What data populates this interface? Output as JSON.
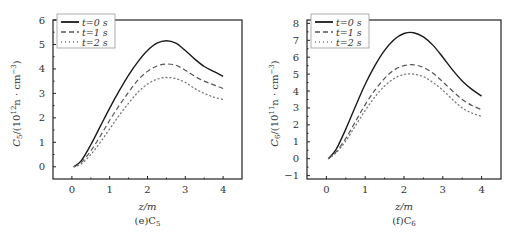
{
  "chart_data": [
    {
      "type": "line",
      "panel_label": "(e)C5",
      "title": "",
      "xlabel": "z/m",
      "ylabel": "C5/(10^12 n · cm^-3)",
      "xlim": [
        -0.5,
        4.5
      ],
      "ylim": [
        -0.5,
        6
      ],
      "xticks": [
        0,
        1,
        2,
        3,
        4
      ],
      "yticks": [
        0,
        1,
        2,
        3,
        4,
        5,
        6
      ],
      "grid": false,
      "legend_position": "upper left",
      "x": [
        0.05,
        0.25,
        0.5,
        0.75,
        1.0,
        1.25,
        1.5,
        1.75,
        2.0,
        2.25,
        2.5,
        2.75,
        3.0,
        3.25,
        3.5,
        3.75,
        4.0
      ],
      "series": [
        {
          "name": "t=0 s",
          "style": "solid",
          "values": [
            0.0,
            0.25,
            0.9,
            1.65,
            2.4,
            3.1,
            3.75,
            4.3,
            4.75,
            5.05,
            5.15,
            5.05,
            4.75,
            4.4,
            4.1,
            3.9,
            3.7
          ]
        },
        {
          "name": "t=1 s",
          "style": "dashed",
          "values": [
            0.0,
            0.18,
            0.65,
            1.25,
            1.9,
            2.5,
            3.05,
            3.55,
            3.9,
            4.12,
            4.2,
            4.15,
            3.95,
            3.7,
            3.5,
            3.35,
            3.2
          ]
        },
        {
          "name": "t=2 s",
          "style": "dotted",
          "values": [
            0.0,
            0.12,
            0.5,
            1.0,
            1.55,
            2.1,
            2.6,
            3.05,
            3.38,
            3.58,
            3.65,
            3.6,
            3.45,
            3.2,
            3.0,
            2.85,
            2.75
          ]
        }
      ]
    },
    {
      "type": "line",
      "panel_label": "(f)C6",
      "title": "",
      "xlabel": "z/m",
      "ylabel": "C6/(10^11 n · cm^-3)",
      "xlim": [
        -0.5,
        4.5
      ],
      "ylim": [
        -1.2,
        8.2
      ],
      "xticks": [
        0,
        1,
        2,
        3,
        4
      ],
      "yticks": [
        -1,
        0,
        1,
        2,
        3,
        4,
        5,
        6,
        7,
        8
      ],
      "grid": false,
      "legend_position": "upper left",
      "x": [
        0.05,
        0.25,
        0.5,
        0.75,
        1.0,
        1.25,
        1.5,
        1.75,
        2.0,
        2.25,
        2.5,
        2.75,
        3.0,
        3.25,
        3.5,
        3.75,
        4.0
      ],
      "series": [
        {
          "name": "t=0 s",
          "style": "solid",
          "values": [
            0.0,
            0.55,
            1.75,
            3.1,
            4.4,
            5.5,
            6.4,
            7.05,
            7.4,
            7.45,
            7.2,
            6.7,
            6.0,
            5.25,
            4.6,
            4.1,
            3.7
          ]
        },
        {
          "name": "t=1 s",
          "style": "dashed",
          "values": [
            0.0,
            0.4,
            1.2,
            2.2,
            3.2,
            4.05,
            4.75,
            5.25,
            5.5,
            5.55,
            5.4,
            5.05,
            4.55,
            4.0,
            3.5,
            3.15,
            2.9
          ]
        },
        {
          "name": "t=2 s",
          "style": "dotted",
          "values": [
            0.0,
            0.35,
            1.05,
            1.95,
            2.85,
            3.65,
            4.3,
            4.75,
            4.98,
            5.0,
            4.85,
            4.5,
            4.05,
            3.5,
            3.0,
            2.7,
            2.5
          ]
        }
      ]
    }
  ],
  "panels": [
    {
      "ylabel_main": "C",
      "ylabel_sub": "5",
      "ylabel_rest": "/(10",
      "ylabel_sup": "12",
      "ylabel_tail": "n · cm",
      "ylabel_sup2": "−3",
      "ylabel_close": ")",
      "xlabel": "z/m",
      "caption_prefix": "(e)C",
      "caption_sub": "5",
      "legend": [
        "t=0  s",
        "t=1  s",
        "t=2  s"
      ]
    },
    {
      "ylabel_main": "C",
      "ylabel_sub": "6",
      "ylabel_rest": "/(10",
      "ylabel_sup": "11",
      "ylabel_tail": "n · cm",
      "ylabel_sup2": "−3",
      "ylabel_close": ")",
      "xlabel": "z/m",
      "caption_prefix": "(f)C",
      "caption_sub": "6",
      "legend": [
        "t=0  s",
        "t=1  s",
        "t=2  s"
      ]
    }
  ],
  "colors": {
    "axis": "#222222",
    "solid": "#1a1a1a",
    "dashed": "#555555",
    "dotted": "#777777",
    "text": "#333333",
    "legend_border": "#999999"
  }
}
